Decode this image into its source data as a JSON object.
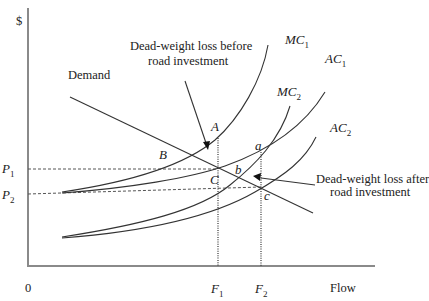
{
  "figure": {
    "y_axis_label": "$",
    "x_axis_label": "Flow",
    "origin_label": "0",
    "price_labels": [
      {
        "base": "P",
        "sub": "1"
      },
      {
        "base": "P",
        "sub": "2"
      }
    ],
    "flow_labels": [
      {
        "base": "F",
        "sub": "1"
      },
      {
        "base": "F",
        "sub": "2"
      }
    ],
    "curves": [
      {
        "name": "demand",
        "label": "Demand"
      },
      {
        "name": "mc1",
        "base": "MC",
        "sub": "1"
      },
      {
        "name": "ac1",
        "base": "AC",
        "sub": "1"
      },
      {
        "name": "mc2",
        "base": "MC",
        "sub": "2"
      },
      {
        "name": "ac2",
        "base": "AC",
        "sub": "2"
      }
    ],
    "points": {
      "A": "A",
      "B": "B",
      "C": "C",
      "a": "a",
      "b": "b",
      "c": "c"
    },
    "annotations": {
      "before_line1": "Dead-weight loss before",
      "before_line2": "road investment",
      "after_line1": "Dead-weight loss after",
      "after_line2": "road investment"
    }
  }
}
